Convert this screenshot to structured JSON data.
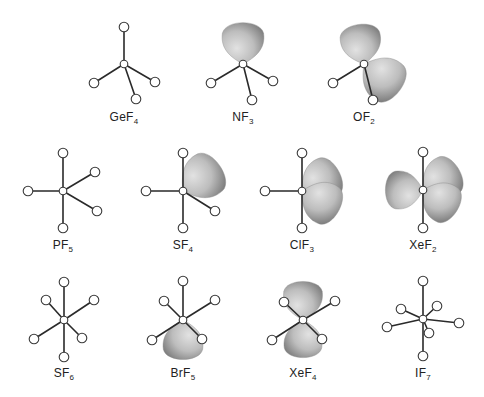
{
  "figure": {
    "colors": {
      "lobe_light": "#d6d6d6",
      "lobe_dark": "#8a8a8a",
      "bond": "#2a2a2a",
      "atom_stroke": "#3a3a3a"
    },
    "molecules": [
      {
        "id": "GeF4",
        "formula": "GeF",
        "subscript": "4",
        "center": [
          124,
          64
        ],
        "lx": 124,
        "ly": 110,
        "ligands": [
          [
            124,
            27
          ],
          [
            94,
            83
          ],
          [
            136,
            99
          ],
          [
            155,
            82
          ]
        ],
        "lobes": []
      },
      {
        "id": "NF3",
        "formula": "NF",
        "subscript": "3",
        "center": [
          243,
          64
        ],
        "lx": 243,
        "ly": 110,
        "ligands": [
          [
            211,
            83
          ],
          [
            252,
            100
          ],
          [
            273,
            81
          ]
        ],
        "lobes": [
          [
            243,
            64,
            243,
            20
          ]
        ]
      },
      {
        "id": "OF2",
        "formula": "OF",
        "subscript": "2",
        "center": [
          364,
          64
        ],
        "lx": 364,
        "ly": 110,
        "ligands": [
          [
            333,
            83
          ],
          [
            373,
            100
          ]
        ],
        "lobes": [
          [
            364,
            64,
            358,
            22
          ],
          [
            364,
            64,
            402,
            92
          ]
        ]
      },
      {
        "id": "PF5",
        "formula": "PF",
        "subscript": "5",
        "center": [
          63,
          191
        ],
        "lx": 63,
        "ly": 238,
        "ligands": [
          [
            63,
            153
          ],
          [
            63,
            228
          ],
          [
            28,
            191
          ],
          [
            95,
            172
          ],
          [
            97,
            211
          ]
        ],
        "lobes": []
      },
      {
        "id": "SF4",
        "formula": "SF",
        "subscript": "4",
        "center": [
          183,
          191
        ],
        "lx": 183,
        "ly": 238,
        "ligands": [
          [
            183,
            153
          ],
          [
            183,
            228
          ],
          [
            146,
            191
          ],
          [
            215,
            211
          ]
        ],
        "lobes": [
          [
            183,
            191,
            222,
            164
          ]
        ]
      },
      {
        "id": "ClF3",
        "formula": "ClF",
        "subscript": "3",
        "center": [
          302,
          191
        ],
        "lx": 302,
        "ly": 238,
        "ligands": [
          [
            302,
            153
          ],
          [
            302,
            228
          ],
          [
            265,
            191
          ]
        ],
        "lobes": [
          [
            302,
            191,
            341,
            170
          ],
          [
            302,
            191,
            341,
            212
          ]
        ]
      },
      {
        "id": "XeF2",
        "formula": "XeF",
        "subscript": "2",
        "center": [
          423,
          190
        ],
        "lx": 423,
        "ly": 238,
        "ligands": [
          [
            423,
            152
          ],
          [
            423,
            228
          ]
        ],
        "lobes": [
          [
            423,
            190,
            383,
            190
          ],
          [
            423,
            190,
            461,
            168
          ],
          [
            423,
            190,
            459,
            212
          ]
        ]
      },
      {
        "id": "SF6",
        "formula": "SF",
        "subscript": "6",
        "center": [
          64,
          320
        ],
        "lx": 64,
        "ly": 366,
        "ligands": [
          [
            64,
            282
          ],
          [
            64,
            357
          ],
          [
            46,
            300
          ],
          [
            94,
            300
          ],
          [
            34,
            339
          ],
          [
            82,
            338
          ]
        ],
        "lobes": []
      },
      {
        "id": "BrF5",
        "formula": "BrF",
        "subscript": "5",
        "center": [
          183,
          320
        ],
        "lx": 183,
        "ly": 366,
        "ligands": [
          [
            183,
            281
          ],
          [
            164,
            301
          ],
          [
            215,
            300
          ],
          [
            152,
            340
          ],
          [
            202,
            339
          ]
        ],
        "lobes": [
          [
            183,
            320,
            183,
            362
          ]
        ]
      },
      {
        "id": "XeF4",
        "formula": "XeF",
        "subscript": "4",
        "center": [
          303,
          320
        ],
        "lx": 303,
        "ly": 366,
        "ligands": [
          [
            284,
            302
          ],
          [
            335,
            301
          ],
          [
            272,
            340
          ],
          [
            322,
            339
          ]
        ],
        "lobes": [
          [
            303,
            320,
            303,
            279
          ],
          [
            303,
            320,
            303,
            360
          ]
        ]
      },
      {
        "id": "IF7",
        "formula": "IF",
        "subscript": "7",
        "center": [
          423,
          319
        ],
        "lx": 423,
        "ly": 366,
        "ligands": [
          [
            423,
            281
          ],
          [
            423,
            356
          ],
          [
            387,
            327
          ],
          [
            459,
            323
          ],
          [
            401,
            309
          ],
          [
            437,
            306
          ],
          [
            429,
            333
          ]
        ],
        "lobes": []
      }
    ]
  }
}
